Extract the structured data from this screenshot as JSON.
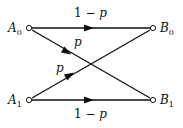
{
  "diagram": {
    "type": "binary-symmetric-channel",
    "nodes": [
      {
        "id": "A0",
        "letter": "A",
        "sub": "0",
        "x": 29,
        "y": 28
      },
      {
        "id": "A1",
        "letter": "A",
        "sub": "1",
        "x": 29,
        "y": 100
      },
      {
        "id": "B0",
        "letter": "B",
        "sub": "0",
        "x": 153,
        "y": 28
      },
      {
        "id": "B1",
        "letter": "B",
        "sub": "1",
        "x": 153,
        "y": 100
      }
    ],
    "edges": [
      {
        "from": "A0",
        "to": "B0",
        "label_num": "1 − ",
        "label_var": "p"
      },
      {
        "from": "A0",
        "to": "B1",
        "label_var": "p"
      },
      {
        "from": "A1",
        "to": "B0",
        "label_var": "p"
      },
      {
        "from": "A1",
        "to": "B1",
        "label_num": "1 − ",
        "label_var": "p"
      }
    ]
  }
}
